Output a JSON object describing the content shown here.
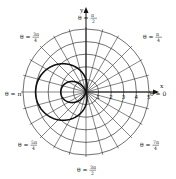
{
  "chart_data": {
    "type": "line",
    "subtype": "polar",
    "title": "",
    "equation": "r = 1 - 3 cos θ",
    "xlabel": "x",
    "ylabel": "y",
    "radial_ticks": [
      "1",
      "2",
      "3",
      "4",
      "5"
    ],
    "rlim": [
      0,
      5
    ],
    "grid": {
      "circles": 5,
      "spoke_step_deg": 15
    },
    "angle_labels": [
      {
        "id": "a0",
        "lhs": "θ = ",
        "num": "0",
        "den": "",
        "angle_deg": 0
      },
      {
        "id": "a45",
        "lhs": "θ = ",
        "num": "π",
        "den": "4",
        "angle_deg": 45
      },
      {
        "id": "a90",
        "lhs": "θ = ",
        "num": "π",
        "den": "2",
        "angle_deg": 90
      },
      {
        "id": "a135",
        "lhs": "θ = ",
        "num": "3π",
        "den": "4",
        "angle_deg": 135
      },
      {
        "id": "a180",
        "lhs": "θ = ",
        "num": "π",
        "den": "",
        "angle_deg": 180
      },
      {
        "id": "a225",
        "lhs": "θ = ",
        "num": "5π",
        "den": "4",
        "angle_deg": 225
      },
      {
        "id": "a270",
        "lhs": "θ = ",
        "num": "3π",
        "den": "2",
        "angle_deg": 270
      },
      {
        "id": "a315",
        "lhs": "θ = ",
        "num": "7π",
        "den": "4",
        "angle_deg": 315
      }
    ],
    "series": [
      {
        "name": "limaçon with inner loop",
        "r_of_theta": "1 - 3cos(theta)",
        "theta_range": [
          0,
          6.2832
        ],
        "key_points": [
          {
            "theta": "0",
            "r": -2
          },
          {
            "theta": "π/2",
            "r": 1
          },
          {
            "theta": "π",
            "r": 4
          },
          {
            "theta": "3π/2",
            "r": 1
          }
        ]
      }
    ],
    "colors": {
      "curve": "#111111",
      "grid": "#333333",
      "axes": "#111111"
    }
  }
}
